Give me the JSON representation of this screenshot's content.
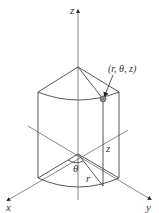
{
  "diagram": {
    "axes": {
      "z_label": "z",
      "x_label": "x",
      "y_label": "y"
    },
    "point_label": "(r, θ, z)",
    "labels": {
      "theta": "θ",
      "r": "r",
      "z": "z"
    },
    "colors": {
      "line": "#444444",
      "point": "#888888",
      "text": "#333333"
    }
  }
}
